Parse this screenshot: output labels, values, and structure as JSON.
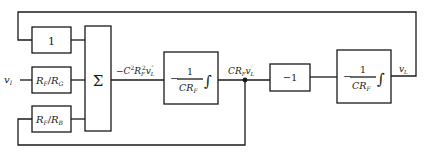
{
  "diagram": {
    "type": "block-diagram",
    "blocks": {
      "gain_one": {
        "label": "1"
      },
      "gain_rf_rg": {
        "num": "R",
        "num_sub": "F",
        "slash": "/",
        "den": "R",
        "den_sub": "G"
      },
      "gain_rf_rb": {
        "num": "R",
        "num_sub": "F",
        "slash": "/",
        "den": "R",
        "den_sub": "B"
      },
      "summer": {
        "label": "Σ"
      },
      "integrator_1": {
        "sign": "−",
        "numerator": "1",
        "denominator": "CR",
        "den_sub": "F",
        "integral": "∫"
      },
      "inverter": {
        "label": "−1"
      },
      "integrator_2": {
        "sign": "−",
        "numerator": "1",
        "denominator": "CR",
        "den_sub": "F",
        "integral": "∫"
      }
    },
    "signals": {
      "input": {
        "label": "v",
        "sub": "I"
      },
      "sum_output": {
        "prefix": "−C",
        "sup1": "2",
        "mid": "R",
        "sub1": "F",
        "sup2": "2",
        "var": "v",
        "sub2": "L",
        "primes": "″"
      },
      "int1_output": {
        "prefix": "CR",
        "sub1": "F",
        "var": "v",
        "sub2": "L",
        "primes": "′"
      },
      "output": {
        "label": "v",
        "sub": "L"
      }
    }
  }
}
